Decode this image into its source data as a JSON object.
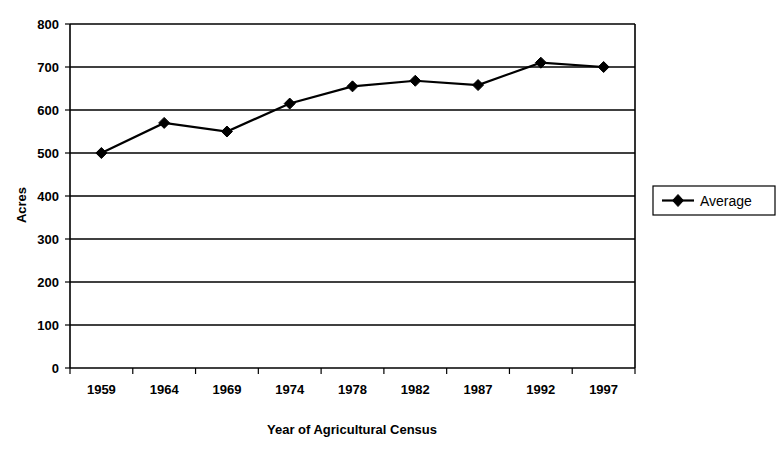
{
  "chart_data": {
    "type": "line",
    "title": "",
    "xlabel": "Year of Agricultural Census",
    "ylabel": "Acres",
    "categories": [
      "1959",
      "1964",
      "1969",
      "1974",
      "1978",
      "1982",
      "1987",
      "1992",
      "1997"
    ],
    "series": [
      {
        "name": "Average",
        "values": [
          500,
          570,
          550,
          615,
          655,
          668,
          658,
          710,
          700
        ],
        "color": "#000000",
        "marker": "diamond"
      }
    ],
    "ylim": [
      0,
      800
    ],
    "ytick_labels": [
      "800",
      "700",
      "600",
      "500",
      "400",
      "300",
      "200",
      "100",
      "0"
    ],
    "ytick_values": [
      800,
      700,
      600,
      500,
      400,
      300,
      200,
      100,
      0
    ],
    "grid": true,
    "grid_axis": "y",
    "legend_position": "right",
    "legend_entries": [
      "Average"
    ]
  },
  "axes": {
    "y_title": "Acres",
    "x_title": "Year of Agricultural Census"
  },
  "legend": {
    "entries": [
      {
        "label": "Average"
      }
    ]
  },
  "colors": {
    "series": "#000000",
    "axis": "#000000",
    "grid": "#000000",
    "background": "#ffffff"
  }
}
